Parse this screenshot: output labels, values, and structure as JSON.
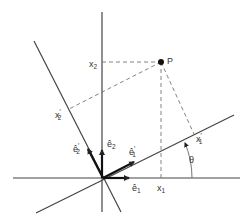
{
  "diagram": {
    "colors": {
      "line": "#333333",
      "dashed": "#777777",
      "background": "#ffffff"
    },
    "origin": {
      "x": 103,
      "y": 178
    },
    "axes": {
      "x1": {
        "from": [
          13,
          178
        ],
        "to": [
          240,
          178
        ]
      },
      "x2": {
        "from": [
          102,
          12
        ],
        "to": [
          102,
          212
        ]
      },
      "x1_prime": {
        "from": [
          36,
          213
        ],
        "to": [
          234,
          115
        ]
      },
      "x2_prime": {
        "from": [
          34,
          41
        ],
        "to": [
          121,
          212
        ]
      }
    },
    "point": {
      "label": "P",
      "x": 161,
      "y": 62
    },
    "labels": {
      "x1": {
        "base": "x",
        "sub": "1"
      },
      "x2": {
        "base": "x",
        "sub": "2"
      },
      "x1_prime": {
        "base": "x",
        "sub": "1",
        "prime": "′"
      },
      "x2_prime": {
        "base": "x",
        "sub": "2",
        "prime": "′"
      },
      "e1": {
        "base": "ê",
        "sub": "1"
      },
      "e2": {
        "base": "ê",
        "sub": "2"
      },
      "e1_prime": {
        "base": "ê",
        "sub": "1",
        "prime": "′"
      },
      "e2_prime": {
        "base": "ê",
        "sub": "2",
        "prime": "′"
      },
      "theta": "θ"
    },
    "vectors": [
      "e1",
      "e2",
      "e1_prime",
      "e2_prime"
    ],
    "icons": {
      "point_marker": "filled-circle-icon",
      "angle_arrow": "arc-arrow-icon"
    }
  }
}
